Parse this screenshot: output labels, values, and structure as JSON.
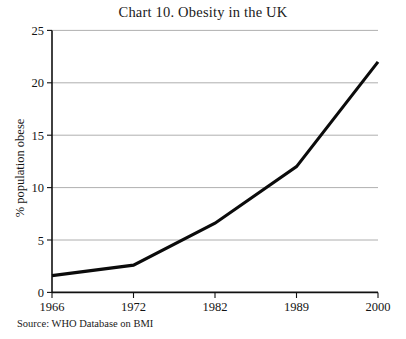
{
  "chart_data": {
    "type": "line",
    "title": "Chart 10. Obesity in the UK",
    "xlabel": "",
    "ylabel": "% population obese",
    "categories": [
      "1966",
      "1972",
      "1982",
      "1989",
      "2000"
    ],
    "values": [
      1.6,
      2.6,
      6.6,
      12.0,
      22.0
    ],
    "series": [
      {
        "name": "% population obese",
        "values": [
          1.6,
          2.6,
          6.6,
          12.0,
          22.0
        ]
      }
    ],
    "ylim": [
      0,
      25
    ],
    "yticks": [
      0,
      5,
      10,
      15,
      20,
      25
    ],
    "ytick_labels": [
      "0",
      "5",
      "10",
      "15",
      "20",
      "25"
    ],
    "xtick_labels": [
      "1966",
      "1972",
      "1982",
      "1989",
      "2000"
    ],
    "grid": "horizontal",
    "legend": "none",
    "line_color": "#0b0b0b",
    "grid_color": "#9a9a9a",
    "axis_color": "#111111",
    "background": "#ffffff"
  },
  "source": {
    "note": "Source: WHO Database on BMI"
  }
}
